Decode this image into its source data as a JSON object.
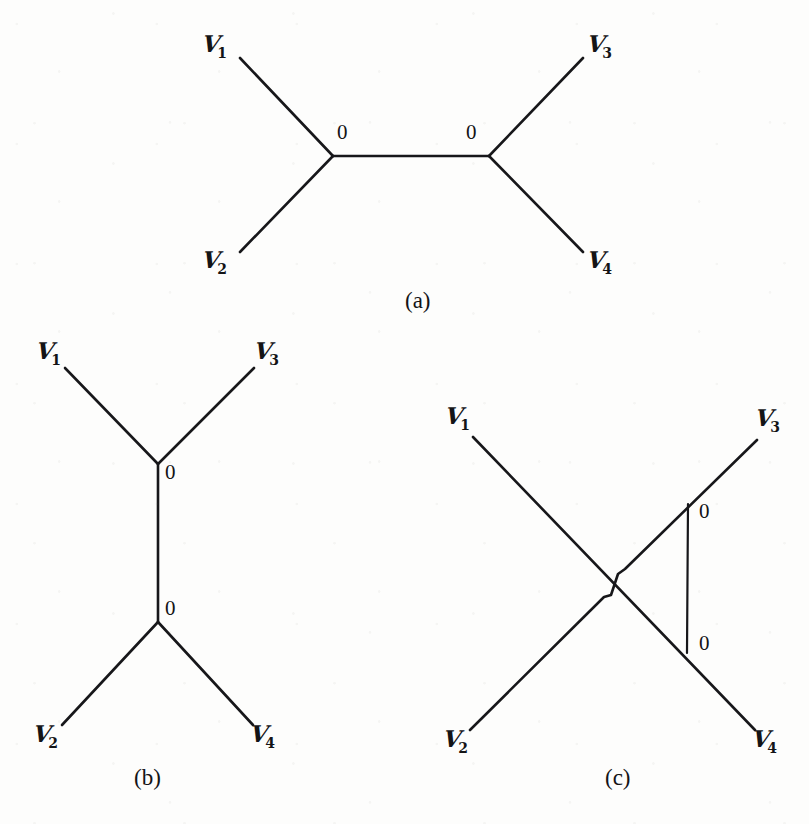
{
  "figure": {
    "background_color": "#fdfdfc",
    "ink_color": "#17171a",
    "panels": [
      {
        "id": "a",
        "caption": "(a)",
        "caption_pos": [
          425,
          291
        ],
        "kind": "tree",
        "description": "Tree with two internal vertices joined by a horizontal edge; V1 and V2 attach to the left vertex, V3 and V4 attach to the right vertex",
        "vertices": [
          {
            "name": "V1",
            "label_text": "V",
            "subscript": "1",
            "pos": [
              240,
              58
            ],
            "label_pos": [
              203,
              32
            ],
            "terminal": true
          },
          {
            "name": "V2",
            "label_text": "V",
            "subscript": "2",
            "pos": [
              240,
              252
            ],
            "label_pos": [
              203,
              248
            ],
            "terminal": true
          },
          {
            "name": "V3",
            "label_text": "V",
            "subscript": "3",
            "pos": [
              583,
              58
            ],
            "label_pos": [
              588,
              32
            ],
            "terminal": true
          },
          {
            "name": "V4",
            "label_text": "V",
            "subscript": "4",
            "pos": [
              583,
              252
            ],
            "label_pos": [
              588,
              248
            ],
            "terminal": true
          },
          {
            "name": "internal-left",
            "pos": [
              333,
              156
            ],
            "weight_label": "0",
            "weight_pos": [
              337,
              122
            ],
            "terminal": false
          },
          {
            "name": "internal-right",
            "pos": [
              489,
              156
            ],
            "weight_label": "0",
            "weight_pos": [
              466,
              122
            ],
            "terminal": false
          }
        ],
        "edges": [
          {
            "from": "V1",
            "to": "internal-left"
          },
          {
            "from": "V2",
            "to": "internal-left"
          },
          {
            "from": "internal-left",
            "to": "internal-right"
          },
          {
            "from": "internal-right",
            "to": "V3"
          },
          {
            "from": "internal-right",
            "to": "V4"
          }
        ]
      },
      {
        "id": "b",
        "caption": "(b)",
        "caption_pos": [
          155,
          768
        ],
        "kind": "tree",
        "description": "Tree with two internal vertices joined by a vertical edge; V1 and V3 attach to the upper vertex, V2 and V4 attach to the lower vertex",
        "vertices": [
          {
            "name": "V1",
            "label_text": "V",
            "subscript": "1",
            "pos": [
              65,
              368
            ],
            "label_pos": [
              37,
              339
            ],
            "terminal": true
          },
          {
            "name": "V3",
            "label_text": "V",
            "subscript": "3",
            "pos": [
              254,
              368
            ],
            "label_pos": [
              255,
              339
            ],
            "terminal": true
          },
          {
            "name": "V2",
            "label_text": "V",
            "subscript": "2",
            "pos": [
              62,
              725
            ],
            "label_pos": [
              34,
              722
            ],
            "terminal": true
          },
          {
            "name": "V4",
            "label_text": "V",
            "subscript": "4",
            "pos": [
              253,
              725
            ],
            "label_pos": [
              251,
              722
            ],
            "terminal": true
          },
          {
            "name": "internal-top",
            "pos": [
              158,
              464
            ],
            "weight_label": "0",
            "weight_pos": [
              165,
              462
            ],
            "terminal": false
          },
          {
            "name": "internal-bottom",
            "pos": [
              158,
              622
            ],
            "weight_label": "0",
            "weight_pos": [
              165,
              598
            ],
            "terminal": false
          }
        ],
        "edges": [
          {
            "from": "V1",
            "to": "internal-top"
          },
          {
            "from": "V3",
            "to": "internal-top"
          },
          {
            "from": "internal-top",
            "to": "internal-bottom"
          },
          {
            "from": "internal-bottom",
            "to": "V2"
          },
          {
            "from": "internal-bottom",
            "to": "V4"
          }
        ]
      },
      {
        "id": "c",
        "caption": "(c)",
        "caption_pos": [
          625,
          768
        ],
        "kind": "crossing",
        "description": "Two long diagonals V1-V4 and V2-V3 crossing (the V2-V3 line jogs over the crossing), plus a vertical edge joining a point on the V2-V3 line to a point on the V1-V4 line, labelled 0 at both ends",
        "vertices": [
          {
            "name": "V1",
            "label_text": "V",
            "subscript": "1",
            "pos": [
              473,
              437
            ],
            "label_pos": [
              446,
              404
            ],
            "terminal": true
          },
          {
            "name": "V3",
            "label_text": "V",
            "subscript": "3",
            "pos": [
              757,
              440
            ],
            "label_pos": [
              756,
              406
            ],
            "terminal": true
          },
          {
            "name": "V2",
            "label_text": "V",
            "subscript": "2",
            "pos": [
              470,
              730
            ],
            "label_pos": [
              444,
              727
            ],
            "terminal": true
          },
          {
            "name": "V4",
            "label_text": "V",
            "subscript": "4",
            "pos": [
              755,
              730
            ],
            "label_pos": [
              753,
              727
            ],
            "terminal": true
          },
          {
            "name": "vertical-top",
            "pos": [
              688,
              504
            ],
            "weight_label": "0",
            "weight_pos": [
              699,
              501
            ],
            "terminal": false
          },
          {
            "name": "vertical-bottom",
            "pos": [
              687,
              653
            ],
            "weight_label": "0",
            "weight_pos": [
              699,
              633
            ],
            "terminal": false
          }
        ],
        "edges": [
          {
            "from": "V1",
            "to": "V4"
          },
          {
            "from": "V2",
            "to": "V3"
          },
          {
            "from": "vertical-top",
            "to": "vertical-bottom"
          }
        ]
      }
    ]
  }
}
